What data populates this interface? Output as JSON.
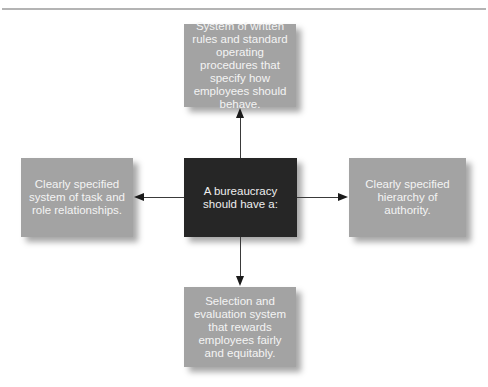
{
  "diagram": {
    "center": {
      "text": "A bureaucracy should have a:"
    },
    "nodes": {
      "top": {
        "text": "System of written rules and standard operating procedures that specify how employees should behave."
      },
      "left": {
        "text": "Clearly specified system of task and role relationships."
      },
      "right": {
        "text": "Clearly specified hierarchy of authority."
      },
      "bottom": {
        "text": "Selection and evaluation system that rewards employees fairly and equitably."
      }
    },
    "edges": [
      {
        "from": "center",
        "to": "top"
      },
      {
        "from": "center",
        "to": "left"
      },
      {
        "from": "center",
        "to": "right"
      },
      {
        "from": "center",
        "to": "bottom"
      }
    ],
    "colors": {
      "center_fill": "#262626",
      "node_fill": "#a3a3a3",
      "text_light": "#f4f4f4",
      "arrow": "#1a1a1a",
      "rule": "#b4b4b4"
    }
  }
}
